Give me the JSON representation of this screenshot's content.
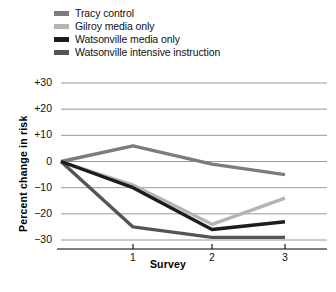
{
  "chart_data": {
    "type": "line",
    "title": "",
    "xlabel": "Survey",
    "ylabel": "Percent change in risk",
    "x": [
      1,
      2,
      3
    ],
    "xtick_labels": [
      "1",
      "2",
      "3"
    ],
    "ytick_labels": [
      "+30",
      "+20",
      "+10",
      "0",
      "-10",
      "-20",
      "-30"
    ],
    "ytick_values": [
      30,
      20,
      10,
      0,
      -10,
      -20,
      -30
    ],
    "ylim": [
      -34,
      32
    ],
    "xlim": [
      0.3,
      3.55
    ],
    "grid": true,
    "grid_axis": "y",
    "legend_position": "above-plot-left",
    "origin_value": 0,
    "series": [
      {
        "name": "Tracy control",
        "color": "#7c7c7c",
        "values": [
          6,
          -1,
          -5
        ],
        "start_value": 0
      },
      {
        "name": "Gilroy media only",
        "color": "#b4b4b4",
        "values": [
          -9,
          -24,
          -14
        ],
        "start_value": 0
      },
      {
        "name": "Watsonville media only",
        "color": "#1c1c1c",
        "values": [
          -10,
          -26,
          -23
        ],
        "start_value": 0
      },
      {
        "name": "Watsonville intensive instruction",
        "color": "#555555",
        "values": [
          -25,
          -29,
          -29
        ],
        "start_value": 0
      }
    ]
  },
  "legend": {
    "items": [
      {
        "label": "Tracy control",
        "color": "#7c7c7c"
      },
      {
        "label": "Gilroy media only",
        "color": "#b4b4b4"
      },
      {
        "label": "Watsonville media only",
        "color": "#1c1c1c"
      },
      {
        "label": "Watsonville intensive instruction",
        "color": "#555555"
      }
    ]
  },
  "axes": {
    "y_title": "Percent change in risk",
    "x_title": "Survey",
    "y_labels": [
      "+30",
      "+20",
      "+10",
      "0",
      "-10",
      "-20",
      "-30"
    ],
    "x_labels": [
      "1",
      "2",
      "3"
    ]
  },
  "caption_fragment": ""
}
